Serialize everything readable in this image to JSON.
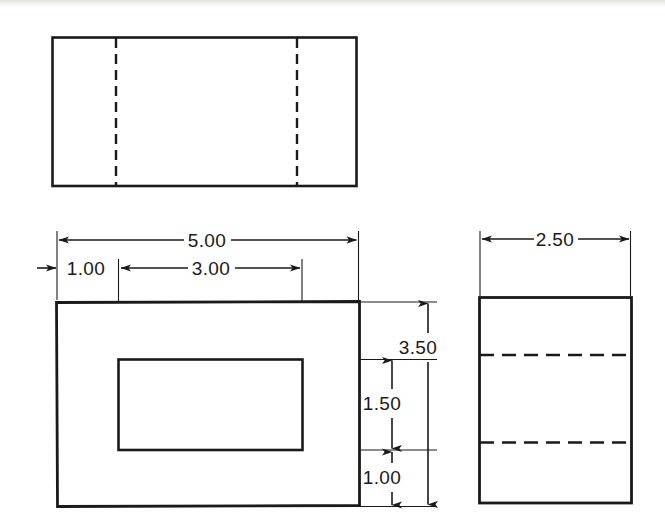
{
  "document": {
    "type": "engineering-drawing",
    "title": "Multiview Orthographic Projection",
    "units": "inches",
    "background_color": "#ffffff",
    "line_color": "#1a1a1a"
  },
  "views": {
    "top": {
      "name": "Top View",
      "outline": {
        "x": 52,
        "y": 37,
        "width": 305,
        "height": 149
      },
      "hidden_lines": [
        {
          "orientation": "vertical",
          "x": 116,
          "y1": 38,
          "y2": 186
        },
        {
          "orientation": "vertical",
          "x": 297,
          "y1": 38,
          "y2": 186
        }
      ]
    },
    "front": {
      "name": "Front View",
      "outline": {
        "x": 56,
        "y": 302,
        "width": 304,
        "height": 205
      },
      "inner_cutout": {
        "x": 118,
        "y": 359,
        "width": 185,
        "height": 91
      }
    },
    "side": {
      "name": "Right Side View",
      "outline": {
        "x": 479,
        "y": 297,
        "width": 153,
        "height": 206
      },
      "hidden_lines": [
        {
          "orientation": "horizontal",
          "y": 355,
          "x1": 480,
          "x2": 631
        },
        {
          "orientation": "horizontal",
          "y": 442,
          "x1": 480,
          "x2": 631
        }
      ]
    }
  },
  "dimensions": [
    {
      "id": "overall-width",
      "label": "5.00",
      "value": 5.0,
      "orientation": "horizontal",
      "view": "front",
      "text_x": 207,
      "text_y": 247,
      "line_y": 240,
      "x1": 57,
      "x2": 358,
      "arrows": "both-inside"
    },
    {
      "id": "left-wall-width",
      "label": "1.00",
      "value": 1.0,
      "orientation": "horizontal",
      "view": "front",
      "text_x": 86,
      "text_y": 275,
      "line_y": 268,
      "x1": 57,
      "x2": 118,
      "arrows": "outside-left"
    },
    {
      "id": "cutout-width",
      "label": "3.00",
      "value": 3.0,
      "orientation": "horizontal",
      "view": "front",
      "text_x": 211,
      "text_y": 275,
      "line_y": 268,
      "x1": 119,
      "x2": 301,
      "arrows": "both-inside"
    },
    {
      "id": "overall-height",
      "label": "3.50",
      "value": 3.5,
      "orientation": "vertical",
      "view": "front",
      "text_x": 418,
      "text_y": 354,
      "line_x": 428,
      "y1": 302,
      "y2": 506,
      "arrows": "both-inside"
    },
    {
      "id": "cutout-height",
      "label": "1.50",
      "value": 1.5,
      "orientation": "vertical",
      "view": "front",
      "text_x": 382,
      "text_y": 410,
      "line_x": 392,
      "y1": 359,
      "y2": 450,
      "arrows": "both-inside"
    },
    {
      "id": "lower-wall-height",
      "label": "1.00",
      "value": 1.0,
      "orientation": "vertical",
      "view": "front",
      "text_x": 382,
      "text_y": 484,
      "line_x": 392,
      "y1": 451,
      "y2": 506,
      "arrows": "both-inside"
    },
    {
      "id": "depth",
      "label": "2.50",
      "value": 2.5,
      "orientation": "horizontal",
      "view": "side",
      "text_x": 555,
      "text_y": 246,
      "line_y": 239,
      "x1": 481,
      "x2": 629,
      "arrows": "both-inside"
    }
  ]
}
